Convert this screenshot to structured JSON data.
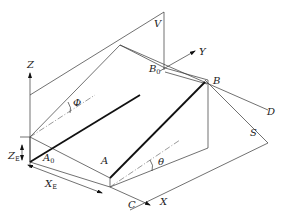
{
  "diagram": {
    "type": "isometric-geometry",
    "axes": {
      "z": "Z",
      "y": "Y",
      "x": "X"
    },
    "planes": {
      "vertical": "V",
      "inclined": "S"
    },
    "points": {
      "a0": "A",
      "a0_sub": "0",
      "a": "A",
      "b0": "B",
      "b0_sub": "0",
      "b": "B",
      "c": "C",
      "d": "D"
    },
    "angles": {
      "phi": "Φ",
      "theta": "θ"
    },
    "dimensions": {
      "ze": "Z",
      "ze_sub": "E",
      "xe": "X",
      "xe_sub": "E"
    }
  }
}
